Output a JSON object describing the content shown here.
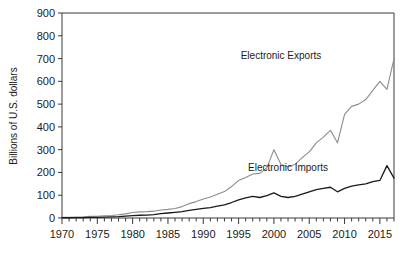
{
  "chart_data": {
    "type": "line",
    "title": "",
    "xlabel": "",
    "ylabel": "Billions of U.S. dollars",
    "xlim": [
      1970,
      2017
    ],
    "ylim": [
      0,
      900
    ],
    "grid": false,
    "legend_position": "inline-annotation",
    "ytick_labels": [
      "0",
      "100",
      "200",
      "300",
      "400",
      "500",
      "600",
      "700",
      "800",
      "900"
    ],
    "ytick_values": [
      0,
      100,
      200,
      300,
      400,
      500,
      600,
      700,
      800,
      900
    ],
    "xtick_labels": [
      "1970",
      "1975",
      "1980",
      "1985",
      "1990",
      "1995",
      "2000",
      "2005",
      "2010",
      "2015"
    ],
    "xtick_values": [
      1970,
      1975,
      1980,
      1985,
      1990,
      1995,
      2000,
      2005,
      2010,
      2015
    ],
    "minor_x_step": 1,
    "x": [
      1970,
      1971,
      1972,
      1973,
      1974,
      1975,
      1976,
      1977,
      1978,
      1979,
      1980,
      1981,
      1982,
      1983,
      1984,
      1985,
      1986,
      1987,
      1988,
      1989,
      1990,
      1991,
      1992,
      1993,
      1994,
      1995,
      1996,
      1997,
      1998,
      1999,
      2000,
      2001,
      2002,
      2003,
      2004,
      2005,
      2006,
      2007,
      2008,
      2009,
      2010,
      2011,
      2012,
      2013,
      2014,
      2015,
      2016,
      2017
    ],
    "series": [
      {
        "name": "Electronic Exports",
        "color": "#8c8c8c",
        "width": 1.1,
        "label_x": 2001,
        "label_y": 700,
        "values": [
          3,
          3,
          4,
          5,
          7,
          8,
          10,
          11,
          14,
          18,
          24,
          27,
          28,
          30,
          35,
          38,
          42,
          50,
          63,
          72,
          83,
          92,
          104,
          116,
          138,
          165,
          178,
          193,
          196,
          220,
          300,
          235,
          225,
          235,
          265,
          290,
          330,
          355,
          385,
          330,
          455,
          490,
          500,
          520,
          560,
          600,
          565,
          700
        ]
      },
      {
        "name": "Electronic Imports",
        "color": "#1a1a1a",
        "width": 1.3,
        "label_x": 2002,
        "label_y": 205,
        "values": [
          1,
          1,
          2,
          2,
          3,
          3,
          4,
          5,
          6,
          8,
          10,
          12,
          13,
          15,
          19,
          22,
          25,
          28,
          33,
          38,
          42,
          46,
          52,
          58,
          68,
          80,
          88,
          95,
          90,
          98,
          110,
          95,
          90,
          95,
          105,
          115,
          125,
          130,
          135,
          115,
          130,
          140,
          145,
          150,
          160,
          165,
          230,
          175
        ]
      }
    ],
    "annotations": [
      {
        "text": "Electronic Exports",
        "x": 2001,
        "y": 700
      },
      {
        "text": "Electronic Imports",
        "x": 2002,
        "y": 205
      }
    ]
  },
  "axes": {
    "ylabel": "Billions of U.S. dollars"
  },
  "colors": {
    "exports": "#8c8c8c",
    "imports": "#1a1a1a",
    "frame": "#3a3a3a",
    "background": "#ffffff"
  }
}
